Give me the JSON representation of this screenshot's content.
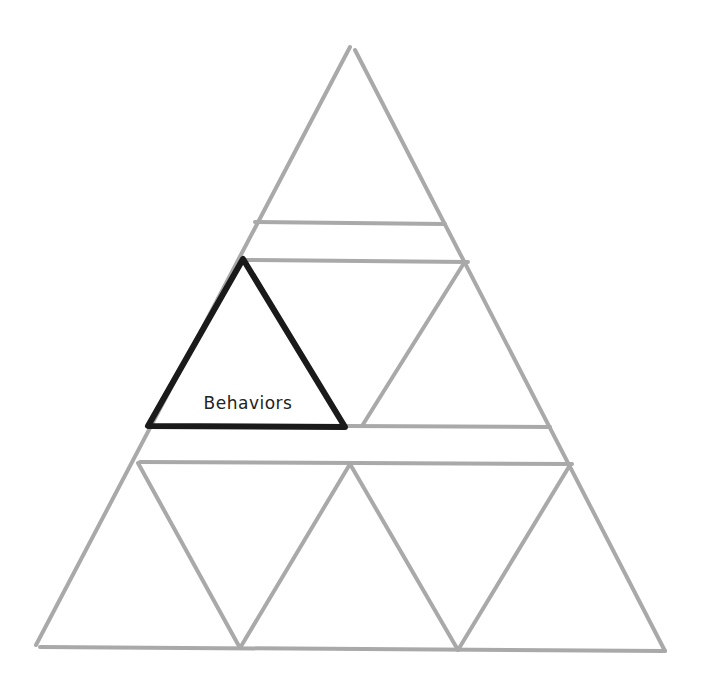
{
  "diagram": {
    "type": "nested-triangle-pyramid",
    "colors": {
      "grid_line": "#a9a9a9",
      "highlight_line": "#1a1a1a",
      "background": "#ffffff",
      "label_text": "#222222"
    },
    "highlighted_cell": {
      "label": "Behaviors",
      "row": 2,
      "position": "left"
    },
    "rows": [
      {
        "row": 1,
        "cells": [
          "apex"
        ]
      },
      {
        "row": 2,
        "cells": [
          "Behaviors",
          "unlabeled"
        ]
      },
      {
        "row": 3,
        "cells": [
          "unlabeled",
          "unlabeled",
          "unlabeled",
          "unlabeled"
        ]
      }
    ]
  }
}
